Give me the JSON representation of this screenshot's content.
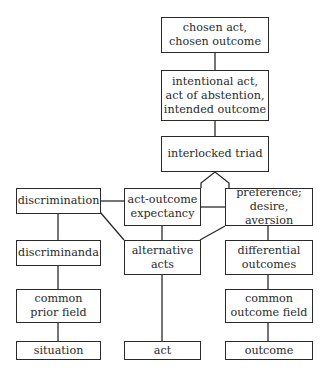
{
  "diagram": {
    "nodes": {
      "chosen": {
        "label": "chosen act,\nchosen outcome"
      },
      "intentional": {
        "label": "intentional act,\nact of abstention,\nintended outcome"
      },
      "triad": {
        "label": "interlocked triad"
      },
      "discrimination": {
        "label": "discrimination"
      },
      "expectancy": {
        "label": "act-outcome\nexpectancy"
      },
      "preference": {
        "label": "preference;\ndesire, aversion"
      },
      "discriminanda": {
        "label": "discriminanda"
      },
      "alternative_acts": {
        "label": "alternative\nacts"
      },
      "differential_outcomes": {
        "label": "differential\noutcomes"
      },
      "prior_field": {
        "label": "common\nprior field"
      },
      "outcome_field": {
        "label": "common\noutcome field"
      },
      "situation": {
        "label": "situation"
      },
      "act": {
        "label": "act"
      },
      "outcome": {
        "label": "outcome"
      }
    },
    "edges": [
      [
        "chosen",
        "intentional"
      ],
      [
        "intentional",
        "triad"
      ],
      [
        "triad",
        "expectancy"
      ],
      [
        "triad",
        "preference"
      ],
      [
        "discrimination",
        "expectancy"
      ],
      [
        "discrimination",
        "alternative_acts"
      ],
      [
        "expectancy",
        "preference"
      ],
      [
        "expectancy",
        "alternative_acts"
      ],
      [
        "preference",
        "alternative_acts"
      ],
      [
        "discrimination",
        "discriminanda"
      ],
      [
        "discriminanda",
        "prior_field"
      ],
      [
        "prior_field",
        "situation"
      ],
      [
        "alternative_acts",
        "act"
      ],
      [
        "preference",
        "differential_outcomes"
      ],
      [
        "differential_outcomes",
        "outcome_field"
      ],
      [
        "outcome_field",
        "outcome"
      ]
    ],
    "colors": {
      "stroke": "#2a2a2a",
      "background": "#ffffff"
    }
  }
}
